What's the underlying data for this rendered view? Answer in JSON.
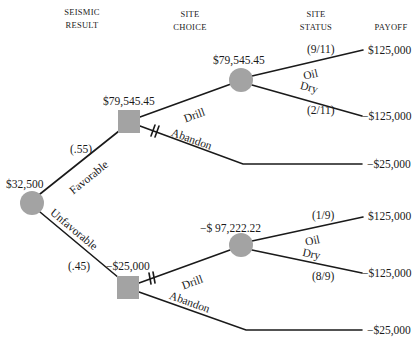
{
  "headers": {
    "seismic_result_line1": "SEISMIC",
    "seismic_result_line2": "RESULT",
    "site_choice_line1": "SITE",
    "site_choice_line2": "CHOICE",
    "site_status_line1": "SITE",
    "site_status_line2": "STATUS",
    "payoff": "PAYOFF"
  },
  "nodes": {
    "root": {
      "type": "chance",
      "value": "$32,500"
    },
    "decision_favorable": {
      "type": "decision",
      "value": "$79,545.45"
    },
    "decision_unfavorable": {
      "type": "decision",
      "value": "−$25,000"
    },
    "chance_fav_drill": {
      "type": "chance",
      "value": "$79,545.45"
    },
    "chance_unfav_drill": {
      "type": "chance",
      "value": "−$ 97,222.22"
    }
  },
  "branches": {
    "favorable": {
      "label": "Favorable",
      "prob": "(.55)"
    },
    "unfavorable": {
      "label": "Unfavorable",
      "prob": "(.45)"
    },
    "fav_drill": {
      "label": "Drill"
    },
    "fav_abandon": {
      "label": "Abandon"
    },
    "unfav_drill": {
      "label": "Drill"
    },
    "unfav_abandon": {
      "label": "Abandon"
    },
    "fav_oil": {
      "label": "Oil",
      "prob": "(9/11)"
    },
    "fav_dry": {
      "label": "Dry",
      "prob": "(2/11)"
    },
    "unfav_oil": {
      "label": "Oil",
      "prob": "(1/9)"
    },
    "unfav_dry": {
      "label": "Dry",
      "prob": "(8/9)"
    }
  },
  "payoffs": {
    "fav_oil": "$125,000",
    "fav_dry": "−$125,000",
    "fav_abandon": "−$25,000",
    "unfav_oil": "$125,000",
    "unfav_dry": "−$125,000",
    "unfav_abandon": "−$25,000"
  },
  "colors": {
    "node_fill": "#a3a3a3",
    "line": "#1a1a1a",
    "text": "#1a1a1a"
  }
}
